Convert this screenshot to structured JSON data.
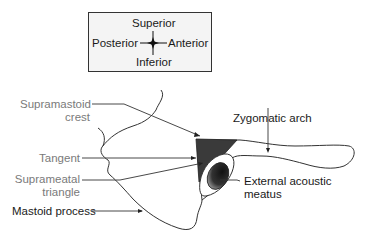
{
  "compass": {
    "superior": "Superior",
    "inferior": "Inferior",
    "posterior": "Posterior",
    "anterior": "Anterior"
  },
  "labels": {
    "supramastoid_crest": {
      "line1": "Supramastoid",
      "line2": "crest"
    },
    "tangent": "Tangent",
    "suprameatal_triangle": {
      "line1": "Suprameatal",
      "line2": "triangle"
    },
    "mastoid_process": "Mastoid process",
    "zygomatic_arch": "Zygomatic arch",
    "external_acoustic_meatus": {
      "line1": "External acoustic",
      "line2": "meatus"
    }
  },
  "colors": {
    "outline": "#333333",
    "triangle_fill": "#3a3a3a",
    "label_dark": "#1a1a1a",
    "label_gray": "#7a7a7a",
    "compass_bg": "#f4f4f4"
  }
}
